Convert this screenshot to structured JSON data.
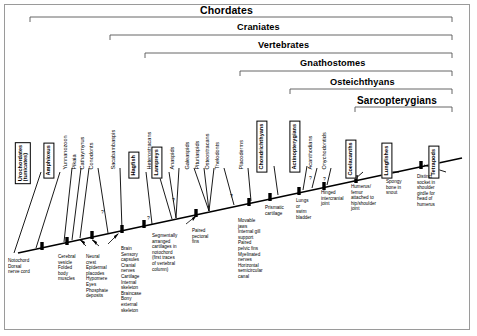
{
  "diagram": {
    "type": "cladogram",
    "frame_border_color": "#9a9a9a",
    "line_color": "#000000",
    "background": "#ffffff"
  },
  "clades": [
    {
      "name": "Chordates",
      "label": "Chordates",
      "x": 30,
      "y": 6,
      "span_left": 30,
      "span_right": 452,
      "bracket_y": 17
    },
    {
      "name": "Craniates",
      "label": "Craniates",
      "x": 110,
      "y": 24,
      "span_left": 110,
      "span_right": 452,
      "bracket_y": 35
    },
    {
      "name": "Vertebrates",
      "label": "Vertebrates",
      "x": 145,
      "y": 42,
      "span_left": 145,
      "span_right": 452,
      "bracket_y": 53
    },
    {
      "name": "Gnathostomes",
      "label": "Gnathostomes",
      "x": 240,
      "y": 60,
      "span_left": 240,
      "span_right": 452,
      "bracket_y": 71
    },
    {
      "name": "Osteichthyans",
      "label": "Osteichthyans",
      "x": 290,
      "y": 78,
      "span_left": 290,
      "span_right": 452,
      "bracket_y": 89
    },
    {
      "name": "Sarcopterygians",
      "label": "Sarcopterygians",
      "x": 355,
      "y": 96,
      "span_left": 355,
      "span_right": 452,
      "bracket_y": 107
    }
  ],
  "taxa": [
    {
      "name": "urochordates",
      "label": "Urochordates",
      "label2": "(tunicates)",
      "x": 32,
      "y": 166,
      "style": "boxed",
      "tip_x": 41,
      "tip_y": 170,
      "base_x": 14,
      "base_y": 253
    },
    {
      "name": "amphioxus",
      "label": "Amphioxus",
      "x": 55,
      "y": 166,
      "style": "boxed",
      "tip_x": 60,
      "tip_y": 170,
      "base_x": 36,
      "base_y": 247
    },
    {
      "name": "yunnanozoon",
      "label": "Yunnanozoon",
      "x": 70,
      "y": 162,
      "style": "plain",
      "tip_x": 72,
      "tip_y": 166,
      "base_x": 64,
      "base_y": 240
    },
    {
      "name": "pikaia",
      "label": "Pikaia",
      "x": 79,
      "y": 162,
      "style": "plain",
      "tip_x": 81,
      "tip_y": 166,
      "base_x": 72,
      "base_y": 238
    },
    {
      "name": "cathaymyrus",
      "label": "Cathaymyrus",
      "x": 87,
      "y": 162,
      "style": "plain",
      "tip_x": 89,
      "tip_y": 166,
      "base_x": 80,
      "base_y": 236
    },
    {
      "name": "conodonts",
      "label": "Conodonts",
      "x": 96,
      "y": 162,
      "style": "plain",
      "tip_x": 98,
      "tip_y": 166,
      "base_x": 108,
      "base_y": 231
    },
    {
      "name": "sacabambaspis",
      "label": "Sacabambaspis",
      "x": 118,
      "y": 162,
      "style": "plain",
      "tip_x": 120,
      "tip_y": 166,
      "base_x": 122,
      "base_y": 228
    },
    {
      "name": "hagfish",
      "label": "Hagfish",
      "x": 140,
      "y": 166,
      "style": "boxed",
      "tip_x": 146,
      "tip_y": 170,
      "base_x": 152,
      "base_y": 222
    },
    {
      "name": "heterostracans",
      "label": "Heterostracans",
      "x": 154,
      "y": 162,
      "style": "plain",
      "tip_x": 156,
      "tip_y": 166,
      "base_x": 170,
      "base_y": 216
    },
    {
      "name": "lampreys",
      "label": "Lampreys",
      "x": 163,
      "y": 166,
      "style": "boxed",
      "tip_x": 169,
      "tip_y": 170,
      "base_x": 176,
      "base_y": 214
    },
    {
      "name": "anaspids",
      "label": "Anaspids",
      "x": 177,
      "y": 162,
      "style": "plain",
      "tip_x": 179,
      "tip_y": 166,
      "base_x": 186,
      "base_y": 211
    },
    {
      "name": "galeaspids",
      "label": "Galeaspids",
      "x": 192,
      "y": 162,
      "style": "plain",
      "tip_x": 194,
      "tip_y": 166,
      "base_x": 208,
      "base_y": 206
    },
    {
      "name": "pituriaspids",
      "label": "Pituriaspids",
      "x": 202,
      "y": 162,
      "style": "plain",
      "tip_x": 204,
      "tip_y": 166,
      "base_x": 209,
      "base_y": 206
    },
    {
      "name": "osteostracans",
      "label": "Osteostracans",
      "x": 212,
      "y": 162,
      "style": "plain",
      "tip_x": 214,
      "tip_y": 166,
      "base_x": 210,
      "base_y": 206
    },
    {
      "name": "thelodonts",
      "label": "Thelodonts",
      "x": 222,
      "y": 162,
      "style": "plain",
      "tip_x": 224,
      "tip_y": 166,
      "base_x": 234,
      "base_y": 200
    },
    {
      "name": "placoderms",
      "label": "Placoderms",
      "x": 246,
      "y": 162,
      "style": "plain",
      "tip_x": 248,
      "tip_y": 166,
      "base_x": 251,
      "base_y": 196
    },
    {
      "name": "chondrichthyans",
      "label": "Chondrichthyans",
      "x": 268,
      "y": 160,
      "style": "boxed",
      "tip_x": 274,
      "tip_y": 164,
      "base_x": 278,
      "base_y": 190
    },
    {
      "name": "actinopterygians",
      "label": "Actinopterygians",
      "x": 301,
      "y": 160,
      "style": "boxed",
      "tip_x": 307,
      "tip_y": 164,
      "base_x": 303,
      "base_y": 185
    },
    {
      "name": "acanthodians",
      "label": "Acanthodians",
      "x": 315,
      "y": 162,
      "style": "plain",
      "tip_x": 317,
      "tip_y": 166,
      "base_x": 312,
      "base_y": 183
    },
    {
      "name": "onychodontids",
      "label": "Onychodontids",
      "x": 329,
      "y": 162,
      "style": "plain",
      "tip_x": 331,
      "tip_y": 166,
      "base_x": 327,
      "base_y": 180
    },
    {
      "name": "coelacanths",
      "label": "Coelacanths",
      "x": 357,
      "y": 166,
      "style": "boxed",
      "tip_x": 363,
      "tip_y": 170,
      "base_x": 355,
      "base_y": 176
    },
    {
      "name": "lungfishes",
      "label": "Lungfishes",
      "x": 393,
      "y": 166,
      "style": "boxed",
      "tip_x": 399,
      "tip_y": 170,
      "base_x": 388,
      "base_y": 170
    },
    {
      "name": "tetrapods",
      "label": "Tetrapods",
      "x": 440,
      "y": 166,
      "style": "boxed",
      "tip_x": 446,
      "tip_y": 170,
      "base_x": 424,
      "base_y": 162
    }
  ],
  "characters": [
    {
      "name": "notochord",
      "text": "Notochord\nDorsal\nnerve cord",
      "x": 24,
      "y": 258,
      "node_x": 42,
      "node_y": 246
    },
    {
      "name": "cerebral-vesicle",
      "text": "Cerebral\nvesicle\nFolded\nbody\nmuscles",
      "x": 59,
      "y": 254,
      "node_x": 67,
      "node_y": 240
    },
    {
      "name": "neural-crest",
      "text": "Neural\ncrest\nEpidermal\nplacodes\nHypomere\nEyes\nPhosphate\ndeposits",
      "x": 86,
      "y": 254,
      "node_x": 92,
      "node_y": 234
    },
    {
      "name": "brain-sensory",
      "text": "Brain\nSensory\ncapsules\nCranial\nnerves\nCartilage\nInternal\nskeleton\nBraincase\nBony\nexternal\nskeleton",
      "x": 122,
      "y": 245,
      "node_x": 122,
      "node_y": 228
    },
    {
      "name": "segmental-cartilages",
      "text": "Segmentally\narranged\ncartilages in\nnotochord\n(first traces\nof vertebral\ncolumn)",
      "x": 152,
      "y": 233,
      "node_x": 144,
      "node_y": 224
    },
    {
      "name": "paired-pectoral-fins",
      "text": "Paired\npectoral\nfins",
      "x": 192,
      "y": 228,
      "node_x": 196,
      "node_y": 214
    },
    {
      "name": "movable-jaws",
      "text": "Movable\njaws\nInternal gill\nsupport\nPaired\npelvic fins\nMyelinated\nnerves\nHorizontal\nsemicircular\ncanal",
      "x": 238,
      "y": 220,
      "node_x": 249,
      "node_y": 209
    },
    {
      "name": "prismatic-cartilage",
      "text": "Prismatic\ncartilage",
      "x": 268,
      "y": 206,
      "node_x": 270,
      "node_y": 201
    },
    {
      "name": "lungs-swim-bladder",
      "text": "Lungs\nor\nswim\nbladder",
      "x": 296,
      "y": 199,
      "node_x": 299,
      "node_y": 194
    },
    {
      "name": "hinged-intercranial-joint",
      "text": "Hinged\nintercranial\njoint",
      "x": 322,
      "y": 191,
      "node_x": 324,
      "node_y": 188
    },
    {
      "name": "humerus-femur",
      "text": "Humerus/\nfemur\nattached to\nhip/shoulder\njoint",
      "x": 352,
      "y": 185,
      "node_x": 356,
      "node_y": 181
    },
    {
      "name": "spongy-bone",
      "text": "Spongy\nbone in\nsnout",
      "x": 387,
      "y": 180,
      "node_x": 389,
      "node_y": 175
    },
    {
      "name": "distinct-socket",
      "text": "Distinct\nsocket in\nshoulder\ngirdle for\nhead of\nhumerus",
      "x": 419,
      "y": 175,
      "node_x": 421,
      "node_y": 169
    }
  ],
  "uncertainty_marks": [
    {
      "name": "q-conodonts",
      "x": 103,
      "y": 212
    },
    {
      "name": "q-hagfish",
      "x": 148,
      "y": 218
    },
    {
      "name": "q-anaspids",
      "x": 173,
      "y": 200
    },
    {
      "name": "q-thelodonts",
      "x": 231,
      "y": 196
    },
    {
      "name": "q-acanthodians",
      "x": 310,
      "y": 178
    },
    {
      "name": "q-onychodontids",
      "x": 324,
      "y": 178
    }
  ],
  "trunk": {
    "x1": 18,
    "y1": 253,
    "x2": 462,
    "y2": 158
  }
}
